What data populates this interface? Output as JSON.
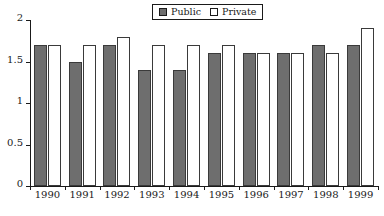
{
  "chart_data": {
    "type": "bar",
    "title": "",
    "xlabel": "",
    "ylabel": "",
    "categories": [
      "1990",
      "1991",
      "1992",
      "1993",
      "1994",
      "1995",
      "1996",
      "1997",
      "1998",
      "1999"
    ],
    "series": [
      {
        "name": "Public",
        "color": "#6e6e6e",
        "values": [
          1.7,
          1.5,
          1.7,
          1.4,
          1.4,
          1.6,
          1.6,
          1.6,
          1.7,
          1.7
        ]
      },
      {
        "name": "Private",
        "color": "#ffffff",
        "values": [
          1.7,
          1.7,
          1.8,
          1.7,
          1.7,
          1.7,
          1.6,
          1.6,
          1.6,
          1.9
        ]
      }
    ],
    "ylim": [
      0,
      2
    ],
    "yticks": [
      0,
      0.5,
      1,
      1.5,
      2
    ],
    "ytick_labels": [
      "0",
      "0.5",
      "1",
      "1.5",
      "2"
    ],
    "grid": false,
    "legend_position": "top-center"
  },
  "legend": {
    "entries": [
      {
        "label": "Public",
        "swatch": "filled-square-icon"
      },
      {
        "label": "Private",
        "swatch": "open-square-icon"
      }
    ]
  }
}
